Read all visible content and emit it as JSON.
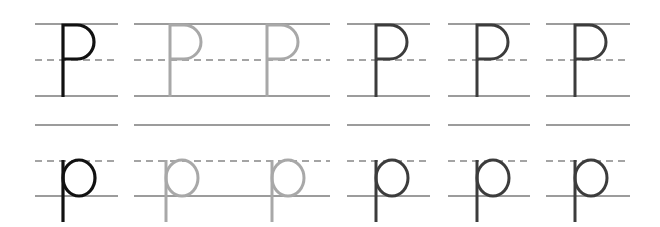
{
  "worksheet": {
    "title": "Letter P handwriting practice",
    "letters": {
      "upper": "P",
      "lower": "p"
    },
    "colors": {
      "line": "#3a3a3a",
      "dash": "#4a4a4a",
      "model_letter": "#111111",
      "trace_letter": "#a8a8a8",
      "practice_letter": "#3c3c3c"
    },
    "rows": [
      {
        "name": "uppercase-row",
        "case": "upper",
        "top_y": 24,
        "mid_y": 60,
        "base_y": 96,
        "cells": [
          {
            "kind": "model",
            "x1": 35,
            "x2": 118,
            "letters": [
              63
            ]
          },
          {
            "kind": "trace",
            "x1": 134,
            "x2": 330,
            "letters": [
              170,
              267
            ]
          },
          {
            "kind": "practice",
            "x1": 347,
            "x2": 430,
            "letters": [
              376
            ]
          },
          {
            "kind": "practice",
            "x1": 448,
            "x2": 530,
            "letters": [
              477
            ]
          },
          {
            "kind": "practice",
            "x1": 546,
            "x2": 630,
            "letters": [
              575
            ]
          }
        ]
      },
      {
        "name": "lowercase-row",
        "case": "lower",
        "top_y": 125,
        "mid_y": 161,
        "base_y": 196,
        "cells": [
          {
            "kind": "model",
            "x1": 35,
            "x2": 118,
            "letters": [
              63
            ]
          },
          {
            "kind": "trace",
            "x1": 134,
            "x2": 330,
            "letters": [
              166,
              272
            ]
          },
          {
            "kind": "practice",
            "x1": 347,
            "x2": 430,
            "letters": [
              376
            ]
          },
          {
            "kind": "practice",
            "x1": 448,
            "x2": 530,
            "letters": [
              477
            ]
          },
          {
            "kind": "practice",
            "x1": 546,
            "x2": 630,
            "letters": [
              575
            ]
          }
        ]
      }
    ]
  }
}
